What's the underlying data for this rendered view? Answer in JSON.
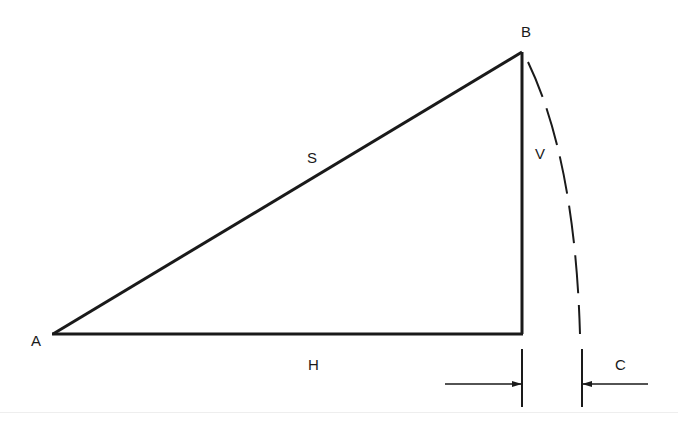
{
  "diagram": {
    "type": "right-triangle-with-arc",
    "colors": {
      "stroke": "#1a1a1a",
      "background": "#ffffff"
    },
    "vertices": {
      "A": {
        "label": "A"
      },
      "B": {
        "label": "B"
      }
    },
    "sides": {
      "hypotenuse": {
        "label": "S"
      },
      "vertical": {
        "label": "V"
      },
      "horizontal": {
        "label": "H"
      }
    },
    "dimension": {
      "label": "C",
      "meaning": "difference between arc end and triangle corner"
    }
  }
}
